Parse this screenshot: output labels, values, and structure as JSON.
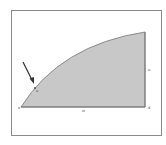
{
  "figure": {
    "type": "area-under-concave-curve",
    "fill_color": "#c8c8c8",
    "edge_color": "#777777",
    "arrow_color": "#333333",
    "labels": {
      "origin": "o",
      "curve_point": "a",
      "base": "w",
      "right_side": "a",
      "right_corner": "d"
    },
    "points": {
      "origin": [
        21,
        107
      ],
      "curve_end": [
        145,
        32
      ],
      "right_base": [
        145,
        107
      ],
      "marked": [
        35,
        88
      ]
    },
    "arrow": {
      "from": [
        23,
        62
      ],
      "to": [
        33,
        83
      ]
    }
  }
}
